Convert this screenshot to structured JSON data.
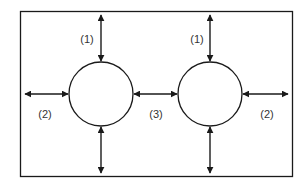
{
  "diagram": {
    "labels": {
      "top_left": "(1)",
      "top_right": "(1)",
      "left": "(2)",
      "middle": "(3)",
      "right": "(2)"
    },
    "colors": {
      "stroke": "#1a1a1a",
      "text": "#333333"
    }
  }
}
